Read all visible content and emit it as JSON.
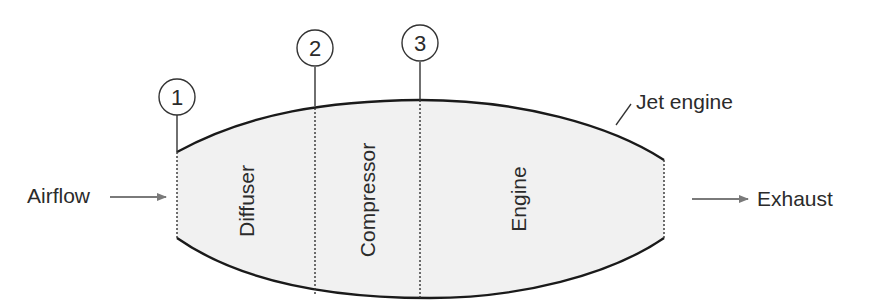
{
  "diagram": {
    "title": "Jet engine",
    "inlet_label": "Airflow",
    "outlet_label": "Exhaust",
    "sections": [
      {
        "label": "Diffuser"
      },
      {
        "label": "Compressor"
      },
      {
        "label": "Engine"
      }
    ],
    "stations": [
      {
        "number": "1"
      },
      {
        "number": "2"
      },
      {
        "number": "3"
      }
    ],
    "colors": {
      "body_fill": "#f1f1f1",
      "outline": "#1a1a1a",
      "arrow": "#7a7a7a",
      "text": "#2b2b2b"
    }
  }
}
